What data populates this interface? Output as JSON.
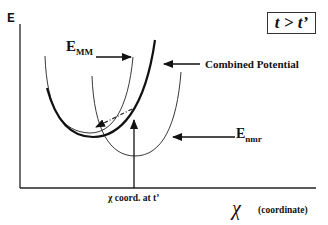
{
  "diagram": {
    "y_axis_label": "E",
    "x_axis_symbol": "χ",
    "x_axis_caption": "(coordinate)",
    "time_condition": "t > t’",
    "labels": {
      "emm_main": "E",
      "emm_sub": "MM",
      "combined": "Combined Potential",
      "enmr_main": "E",
      "enmr_sub": "nmr",
      "chi_coord": "χ coord. at t’"
    },
    "curves": [
      {
        "name": "E_MM",
        "style": "thin",
        "minimum_x": 90
      },
      {
        "name": "Combined Potential",
        "style": "bold",
        "minimum_x": 93
      },
      {
        "name": "E_nmr",
        "style": "thin",
        "minimum_x": 135
      }
    ],
    "colors": {
      "line": "#111111",
      "background": "#ffffff"
    }
  }
}
